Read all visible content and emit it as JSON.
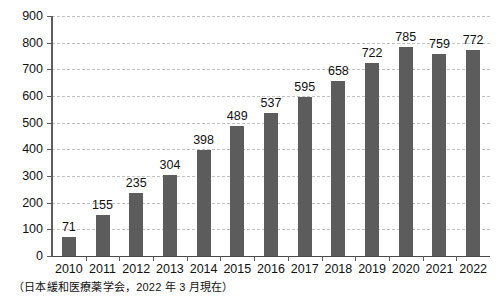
{
  "caption": "（日本緩和医療薬学会，2022 年 3 月現在）",
  "chart_data": {
    "type": "bar",
    "title": "",
    "subtitle": "",
    "xlabel": "",
    "ylabel": "",
    "categories": [
      "2010",
      "2011",
      "2012",
      "2013",
      "2014",
      "2015",
      "2016",
      "2017",
      "2018",
      "2019",
      "2020",
      "2021",
      "2022"
    ],
    "values": [
      71,
      155,
      235,
      304,
      398,
      489,
      537,
      595,
      658,
      722,
      785,
      759,
      772
    ],
    "value_labels": [
      "71",
      "155",
      "235",
      "304",
      "398",
      "489",
      "537",
      "595",
      "658",
      "722",
      "785",
      "759",
      "772"
    ],
    "ylim": [
      0,
      900
    ],
    "ytick_values": [
      0,
      100,
      200,
      300,
      400,
      500,
      600,
      700,
      800,
      900
    ],
    "ytick_labels": [
      "0",
      "100",
      "200",
      "300",
      "400",
      "500",
      "600",
      "700",
      "800",
      "900"
    ],
    "grid": true,
    "grid_axis": "y",
    "grid_style": "dashed",
    "legend": false,
    "legend_position": "none",
    "bar_color": "#5c5c5c",
    "grid_color": "#c2c2c2",
    "axis_color": "#4a4a4a",
    "series": [
      {
        "name": "",
        "values": [
          71,
          155,
          235,
          304,
          398,
          489,
          537,
          595,
          658,
          722,
          785,
          759,
          772
        ]
      }
    ]
  }
}
